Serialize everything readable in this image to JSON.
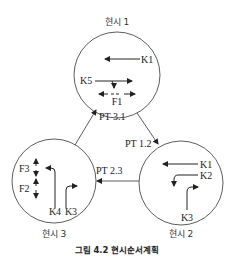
{
  "diagram": {
    "caption": "그림 4.2 현시순서계획",
    "phases": [
      {
        "title": "현시 1",
        "movements": [
          "K1",
          "K5",
          "F1"
        ]
      },
      {
        "title": "현시 2",
        "movements": [
          "K1",
          "K2",
          "K3"
        ]
      },
      {
        "title": "현시 3",
        "movements": [
          "F3",
          "F2",
          "K4",
          "K3"
        ]
      }
    ],
    "transitions": [
      {
        "label": "PT 1.2",
        "from": "현시 1",
        "to": "현시 2"
      },
      {
        "label": "PT 2.3",
        "from": "현시 2",
        "to": "현시 3"
      },
      {
        "label": "PT 3.1",
        "from": "현시 3",
        "to": "현시 1"
      }
    ]
  }
}
